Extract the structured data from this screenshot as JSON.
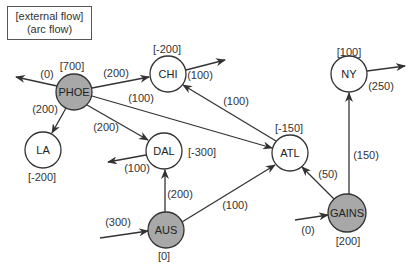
{
  "legend": {
    "line1": "[external flow]",
    "line2": "(arc flow)"
  },
  "nodes": {
    "PHOE": {
      "label": "PHOE",
      "external": "[700]",
      "shaded": true,
      "x": 74,
      "y": 92,
      "r": 18
    },
    "CHI": {
      "label": "CHI",
      "external": "[-200]",
      "shaded": false,
      "x": 168,
      "y": 74,
      "r": 18
    },
    "LA": {
      "label": "LA",
      "external": "[-200]",
      "shaded": false,
      "x": 43,
      "y": 150,
      "r": 18
    },
    "DAL": {
      "label": "DAL",
      "external": "[-300]",
      "shaded": false,
      "x": 164,
      "y": 151,
      "r": 18
    },
    "ATL": {
      "label": "ATL",
      "external": "[-150]",
      "shaded": false,
      "x": 290,
      "y": 153,
      "r": 18
    },
    "AUS": {
      "label": "AUS",
      "external": "[0]",
      "shaded": true,
      "x": 166,
      "y": 230,
      "r": 18
    },
    "NY": {
      "label": "NY",
      "external": "[100]",
      "shaded": false,
      "x": 349,
      "y": 74,
      "r": 18
    },
    "GAINS": {
      "label": "GAINS",
      "external": "[200]",
      "shaded": true,
      "x": 347,
      "y": 213,
      "r": 19
    }
  },
  "arcs": [
    {
      "from": "PHOE",
      "to": "CHI",
      "flow": "(200)"
    },
    {
      "from": "PHOE",
      "to": "LA",
      "flow": "(200)"
    },
    {
      "from": "PHOE",
      "to": "DAL",
      "flow": "(200)"
    },
    {
      "from": "PHOE",
      "to": "ATL",
      "flow": "(100)"
    },
    {
      "from": "PHOE",
      "to": "external-out",
      "flow": "(0)"
    },
    {
      "from": "CHI",
      "to": "external-out",
      "flow": "(100)"
    },
    {
      "from": "ATL",
      "to": "CHI",
      "flow": "(100)"
    },
    {
      "from": "DAL",
      "to": "external-out",
      "flow": "(100)"
    },
    {
      "from": "AUS",
      "to": "DAL",
      "flow": "(200)"
    },
    {
      "from": "AUS",
      "to": "ATL",
      "flow": "(100)"
    },
    {
      "from": "external-in",
      "to": "AUS",
      "flow": "(300)"
    },
    {
      "from": "GAINS",
      "to": "ATL",
      "flow": "(50)"
    },
    {
      "from": "GAINS",
      "to": "NY",
      "flow": "(150)"
    },
    {
      "from": "external-in",
      "to": "GAINS",
      "flow": "(0)"
    },
    {
      "from": "NY",
      "to": "external-out",
      "flow": "(250)"
    }
  ],
  "colors": {
    "shaded_fill": "#a8a8a8",
    "node_stroke": "#333333",
    "line": "#333333"
  }
}
